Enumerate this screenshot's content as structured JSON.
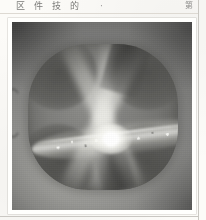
{
  "page": {
    "kind": "scanned-book-page",
    "background_color": "#fcfbf8",
    "rule_color": "#c9c7c2"
  },
  "caption": {
    "characters": [
      "区",
      "件",
      "技",
      "的"
    ],
    "separator": "·",
    "right_mark": "第",
    "text_color": "#5d5d5b"
  },
  "plate": {
    "label": "photographic-plate",
    "border_color": "#fffffd",
    "background_color": "#8b8b89",
    "highlight_color": "#ffffff",
    "shadow_color": "#4e4e4b",
    "object": {
      "name": "four-lobed-luminous-object",
      "lobe_count": 4,
      "has_bright_core": true,
      "has_equatorial_disk": true,
      "disk_tilt_degrees": -7
    }
  }
}
